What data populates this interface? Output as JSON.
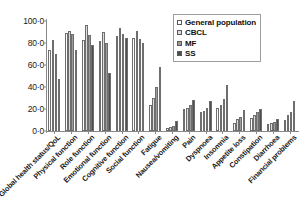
{
  "chart_data": {
    "type": "bar",
    "title": "",
    "xlabel": "",
    "ylabel": "",
    "ylim": [
      0,
      100
    ],
    "ytick_labels": [
      "100·0",
      "80·0",
      "60·0",
      "40·0",
      "20·0",
      "0·0"
    ],
    "ytick_values": [
      100,
      80,
      60,
      40,
      20,
      0
    ],
    "grid": false,
    "legend_position": "top-right",
    "categories": [
      "Global health status/QoL",
      "Physical function",
      "Role function",
      "Emotional function",
      "Cognitive function",
      "Social function",
      "Fatigue",
      "Nausea/vomiting",
      "Pain",
      "Dyspnoea",
      "Insomnia",
      "Appetite loss",
      "Constipation",
      "Diarrhoea",
      "Financial problems"
    ],
    "series": [
      {
        "name": "General population",
        "color": "#fdfdfd",
        "values": [
          74.0,
          89.0,
          83.0,
          82.0,
          86.0,
          85.0,
          24.0,
          3.0,
          20.0,
          17.0,
          21.0,
          7.0,
          12.0,
          6.0,
          10.0
        ]
      },
      {
        "name": "CBCL",
        "color": "#dcdcdc",
        "values": [
          83.0,
          91.0,
          96.0,
          90.0,
          94.0,
          91.0,
          30.0,
          4.0,
          21.0,
          18.0,
          24.0,
          11.0,
          15.0,
          7.0,
          15.0
        ]
      },
      {
        "name": "MF",
        "color": "#9a9a9a",
        "values": [
          70.0,
          88.0,
          87.0,
          80.0,
          88.0,
          84.0,
          40.0,
          5.0,
          24.0,
          21.0,
          29.0,
          13.0,
          17.0,
          8.0,
          17.0
        ]
      },
      {
        "name": "SS",
        "color": "#4d4d4d",
        "values": [
          47.0,
          74.0,
          78.0,
          53.0,
          85.0,
          80.0,
          58.0,
          9.0,
          28.0,
          27.0,
          42.0,
          19.0,
          20.0,
          11.0,
          27.0
        ]
      }
    ]
  },
  "legend": {
    "items": [
      {
        "label": "General population",
        "swatch": "#fdfdfd"
      },
      {
        "label": "CBCL",
        "swatch": "#dcdcdc"
      },
      {
        "label": "MF",
        "swatch": "#9a9a9a"
      },
      {
        "label": "SS",
        "swatch": "#4d4d4d"
      }
    ]
  }
}
